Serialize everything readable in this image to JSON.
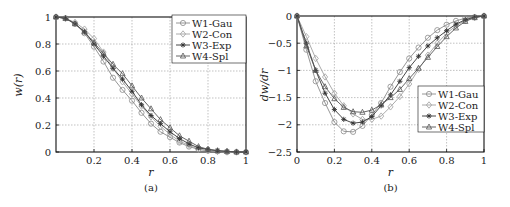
{
  "chart_data": [
    {
      "type": "line",
      "panel": "(a)",
      "caption": "(a)",
      "xlabel": "r",
      "ylabel": "w(r)",
      "xlim": [
        0,
        1
      ],
      "ylim": [
        0,
        1
      ],
      "xticks": [
        0.2,
        0.4,
        0.6,
        0.8,
        1
      ],
      "xtick_labels": [
        "0.2",
        "0.4",
        "0.6",
        "0.8",
        "1"
      ],
      "yticks": [
        0,
        0.2,
        0.4,
        0.6,
        0.8,
        1
      ],
      "ytick_labels": [
        "0",
        "0.2",
        "0.4",
        "0.6",
        "0.8",
        "1"
      ],
      "grid": true,
      "legend_position": "upper right",
      "x": [
        0,
        0.05,
        0.1,
        0.15,
        0.2,
        0.25,
        0.3,
        0.35,
        0.4,
        0.45,
        0.5,
        0.55,
        0.6,
        0.65,
        0.7,
        0.75,
        0.8,
        0.85,
        0.9,
        0.95,
        1.0
      ],
      "series": [
        {
          "name": "W1-Gau",
          "marker": "circle",
          "color": "#8a8a8a",
          "values": [
            1.0,
            0.99,
            0.95,
            0.88,
            0.78,
            0.67,
            0.55,
            0.46,
            0.38,
            0.29,
            0.21,
            0.15,
            0.11,
            0.07,
            0.04,
            0.02,
            0.01,
            0.005,
            0.0,
            0.0,
            0.0
          ]
        },
        {
          "name": "W2-Con",
          "marker": "diamond",
          "color": "#a0a0a0",
          "values": [
            1.0,
            0.99,
            0.96,
            0.91,
            0.84,
            0.74,
            0.62,
            0.52,
            0.43,
            0.34,
            0.26,
            0.19,
            0.13,
            0.08,
            0.05,
            0.02,
            0.01,
            0.005,
            0.0,
            0.0,
            0.0
          ]
        },
        {
          "name": "W3-Exp",
          "marker": "star",
          "color": "#333333",
          "values": [
            1.0,
            0.99,
            0.95,
            0.89,
            0.8,
            0.71,
            0.62,
            0.54,
            0.45,
            0.35,
            0.27,
            0.21,
            0.15,
            0.1,
            0.06,
            0.03,
            0.02,
            0.01,
            0.005,
            0.0,
            0.0
          ]
        },
        {
          "name": "W4-Spl",
          "marker": "triangle",
          "color": "#555555",
          "values": [
            1.0,
            0.99,
            0.95,
            0.89,
            0.81,
            0.73,
            0.65,
            0.58,
            0.49,
            0.4,
            0.32,
            0.24,
            0.18,
            0.12,
            0.08,
            0.04,
            0.02,
            0.01,
            0.005,
            0.0,
            0.0
          ]
        }
      ]
    },
    {
      "type": "line",
      "panel": "(b)",
      "caption": "(b)",
      "xlabel": "r",
      "ylabel": "dw/dr",
      "xlim": [
        0,
        1
      ],
      "ylim": [
        -2.5,
        0
      ],
      "xticks": [
        0,
        0.2,
        0.4,
        0.6,
        0.8,
        1
      ],
      "xtick_labels": [
        "0",
        "0.2",
        "0.4",
        "0.6",
        "0.8",
        "1"
      ],
      "yticks": [
        -2.5,
        -2,
        -1.5,
        -1,
        -0.5,
        0
      ],
      "ytick_labels": [
        "−2.5",
        "−2",
        "−1.5",
        "−1",
        "−0.5",
        "0"
      ],
      "grid": true,
      "legend_position": "lower right",
      "x": [
        0,
        0.05,
        0.1,
        0.15,
        0.2,
        0.25,
        0.3,
        0.35,
        0.4,
        0.45,
        0.5,
        0.55,
        0.6,
        0.65,
        0.7,
        0.75,
        0.8,
        0.85,
        0.9,
        0.95,
        1.0
      ],
      "series": [
        {
          "name": "W1-Gau",
          "marker": "circle",
          "color": "#8a8a8a",
          "values": [
            0,
            -0.62,
            -1.2,
            -1.6,
            -1.95,
            -2.12,
            -2.13,
            -2.02,
            -1.82,
            -1.6,
            -1.3,
            -1.03,
            -0.78,
            -0.58,
            -0.4,
            -0.26,
            -0.16,
            -0.09,
            -0.04,
            -0.02,
            0
          ]
        },
        {
          "name": "W2-Con",
          "marker": "diamond",
          "color": "#a0a0a0",
          "values": [
            0,
            -0.38,
            -0.78,
            -1.12,
            -1.42,
            -1.65,
            -1.8,
            -1.9,
            -1.9,
            -1.84,
            -1.67,
            -1.48,
            -1.25,
            -0.98,
            -0.72,
            -0.5,
            -0.32,
            -0.18,
            -0.08,
            -0.03,
            0
          ]
        },
        {
          "name": "W3-Exp",
          "marker": "star",
          "color": "#333333",
          "values": [
            0,
            -0.5,
            -1.0,
            -1.42,
            -1.72,
            -1.9,
            -1.97,
            -1.95,
            -1.85,
            -1.65,
            -1.45,
            -1.2,
            -0.95,
            -0.74,
            -0.55,
            -0.4,
            -0.27,
            -0.15,
            -0.07,
            -0.02,
            0
          ]
        },
        {
          "name": "W4-Spl",
          "marker": "triangle",
          "color": "#555555",
          "values": [
            0,
            -0.55,
            -1.0,
            -1.3,
            -1.52,
            -1.68,
            -1.76,
            -1.77,
            -1.73,
            -1.63,
            -1.5,
            -1.35,
            -1.15,
            -0.96,
            -0.76,
            -0.56,
            -0.38,
            -0.22,
            -0.1,
            -0.03,
            0
          ]
        }
      ]
    }
  ]
}
